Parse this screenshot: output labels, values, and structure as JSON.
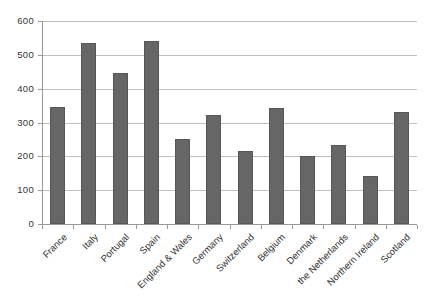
{
  "chart_data": {
    "type": "bar",
    "title": "",
    "xlabel": "",
    "ylabel": "",
    "categories": [
      "France",
      "Italy",
      "Portugal",
      "Spain",
      "England & Wales",
      "Germany",
      "Switzerland",
      "Belgium",
      "Denmark",
      "the Netherlands",
      "Northern Ireland",
      "Scotland"
    ],
    "values": [
      345,
      535,
      445,
      540,
      250,
      323,
      215,
      343,
      200,
      233,
      143,
      332
    ],
    "ylim": [
      0,
      600
    ],
    "ytick_interval": 100,
    "ytick_labels": [
      "600",
      "500",
      "400",
      "300",
      "200",
      "100",
      "0"
    ],
    "grid": true,
    "legend": "none",
    "colors": {
      "bar_fill": "#666666",
      "bar_edge": "#565656",
      "gridline": "#bfbfbf",
      "axis": "#999999",
      "tick": "#999999",
      "text": "#333333",
      "background": "#ffffff"
    }
  }
}
